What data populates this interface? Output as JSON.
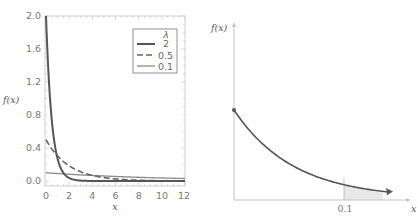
{
  "chart_data": [
    {
      "type": "line",
      "title": "",
      "xlabel": "x",
      "ylabel": "f(x)",
      "xlim": [
        0,
        12
      ],
      "ylim": [
        0,
        2.0
      ],
      "xticks": [
        "0",
        "2",
        "4",
        "6",
        "8",
        "10",
        "12"
      ],
      "yticks": [
        "0.0",
        "0.4",
        "0.8",
        "1.2",
        "1.6",
        "2.0"
      ],
      "grid": false,
      "legend_position": "upper right",
      "legend_title": "λ",
      "function": "f(x) = λ·exp(-λx)",
      "series": [
        {
          "name": "2",
          "lambda": 2,
          "style": "solid-thick",
          "color": "#555555",
          "x": [
            0,
            0.25,
            0.5,
            1,
            1.5,
            2,
            3,
            4,
            6,
            8,
            10,
            12
          ],
          "values": [
            2.0,
            1.213,
            0.736,
            0.271,
            0.1,
            0.037,
            0.005,
            0.0007,
            0.0,
            0.0,
            0.0,
            0.0
          ]
        },
        {
          "name": "0.5",
          "lambda": 0.5,
          "style": "dashed",
          "color": "#666666",
          "x": [
            0,
            1,
            2,
            3,
            4,
            6,
            8,
            10,
            12
          ],
          "values": [
            0.5,
            0.303,
            0.184,
            0.112,
            0.068,
            0.025,
            0.009,
            0.003,
            0.001
          ]
        },
        {
          "name": "0.1",
          "lambda": 0.1,
          "style": "solid-thin",
          "color": "#888888",
          "x": [
            0,
            2,
            4,
            6,
            8,
            10,
            12
          ],
          "values": [
            0.1,
            0.082,
            0.067,
            0.055,
            0.045,
            0.037,
            0.03
          ]
        }
      ]
    },
    {
      "type": "area",
      "title": "",
      "xlabel": "x",
      "ylabel": "f(x)",
      "xticks": [
        "0.1"
      ],
      "annotations": [
        "shaded area under curve for x > 0.1"
      ],
      "series": [
        {
          "name": "f(x)",
          "description": "exponential decay curve starting at a marked point on the y-axis, with arrow indicating continuation"
        }
      ]
    }
  ],
  "left_chart": {
    "ylabel": "f(x)",
    "xlabel": "x",
    "xticks": [
      "0",
      "2",
      "4",
      "6",
      "8",
      "10",
      "12"
    ],
    "yticks": [
      "0.0",
      "0.4",
      "0.8",
      "1.2",
      "1.6",
      "2.0"
    ],
    "legend": {
      "title": "λ",
      "items": [
        "2",
        "0.5",
        "0.1"
      ]
    }
  },
  "right_chart": {
    "ylabel": "f(x)",
    "xlabel": "x",
    "xtick": "0.1"
  },
  "colors": {
    "axis": "#bbbbbb",
    "frame": "#cccccc",
    "curve_dark": "#555555",
    "curve_dashed": "#666666",
    "curve_light": "#888888",
    "shade": "#e6e6e6"
  }
}
